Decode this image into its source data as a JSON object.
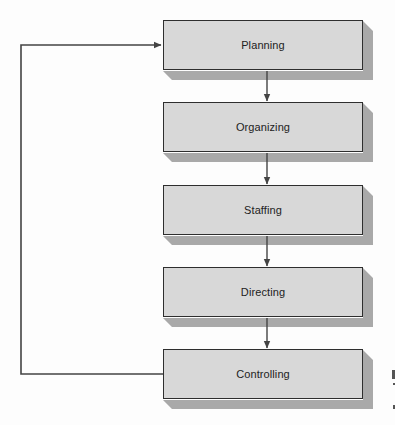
{
  "diagram": {
    "type": "management-process-cycle",
    "steps": [
      {
        "label": "Planning",
        "top": 20
      },
      {
        "label": "Organizing",
        "top": 102
      },
      {
        "label": "Staffing",
        "top": 185
      },
      {
        "label": "Directing",
        "top": 267
      },
      {
        "label": "Controlling",
        "top": 349
      }
    ],
    "flow": [
      {
        "from": "Planning",
        "to": "Organizing"
      },
      {
        "from": "Organizing",
        "to": "Staffing"
      },
      {
        "from": "Staffing",
        "to": "Directing"
      },
      {
        "from": "Directing",
        "to": "Controlling"
      },
      {
        "from": "Controlling",
        "to": "Planning",
        "kind": "feedback-loop"
      }
    ],
    "colors": {
      "box_fill": "#d8d8d8",
      "box_border": "#2e2e2e",
      "shadow": "#a9a9a9",
      "line": "#444444",
      "text": "#222222",
      "background": "#fdfdfd"
    }
  }
}
